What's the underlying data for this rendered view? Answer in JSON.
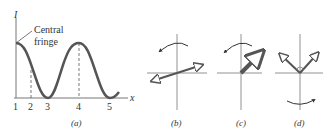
{
  "panel_a": {
    "y_axis_label": "I",
    "x_axis_label": "x",
    "annotation": [
      "Central",
      "fringe"
    ],
    "tick_labels": [
      "1",
      "2",
      "3",
      "4",
      "5"
    ],
    "caption": "(a)"
  },
  "panel_b": {
    "caption": "(b)"
  },
  "panel_c": {
    "caption": "(c)"
  },
  "panel_d": {
    "caption": "(d)"
  },
  "colors": {
    "curve": "#555555",
    "axes": "#777777",
    "text": "#333333"
  }
}
